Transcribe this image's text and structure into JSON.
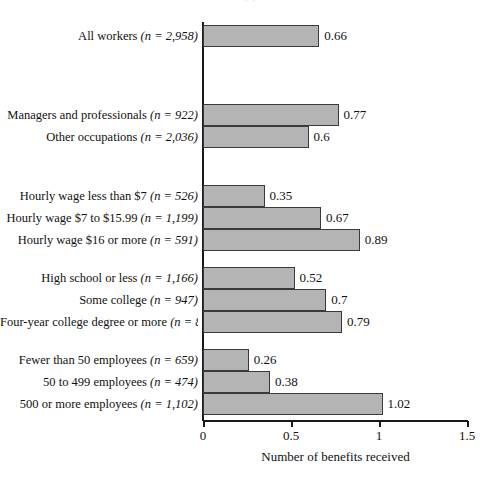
{
  "title_remnant": "( )",
  "axis": {
    "x_title": "Number of benefits received",
    "x_ticks": [
      "0",
      "0.5",
      "1",
      "1.5"
    ],
    "x_min": 0,
    "x_max": 1.5
  },
  "style": {
    "bar_fill": "#b4b4b4",
    "bar_stroke": "#3a3a3a",
    "axis_color": "#1a1a1a",
    "text_color": "#111111"
  },
  "chart_data": {
    "type": "bar",
    "orientation": "horizontal",
    "title": "",
    "xlabel": "Number of benefits received",
    "ylabel": "",
    "xlim": [
      0,
      1.5
    ],
    "grid": false,
    "legend": "none",
    "categories": [
      "All workers (n = 2,958)",
      "Managers and professionals (n = 922)",
      "Other occupations (n = 2,036)",
      "Hourly wage less than $7 (n = 526)",
      "Hourly wage $7 to $15.99 (n = 1,199)",
      "Hourly wage $16 or more (n = 591)",
      "High school or less (n = 1,166)",
      "Some college (n = 947)",
      "Four-year college degree or more (n = 834)",
      "Fewer than 50 employees (n = 659)",
      "50 to 499 employees (n = 474)",
      "500 or more employees (n = 1,102)"
    ],
    "values": [
      0.66,
      0.77,
      0.6,
      0.35,
      0.67,
      0.89,
      0.52,
      0.7,
      0.79,
      0.26,
      0.38,
      1.02
    ],
    "value_labels": [
      "0.66",
      "0.77",
      "0.6",
      "0.35",
      "0.67",
      "0.89",
      "0.52",
      "0.7",
      "0.79",
      "0.26",
      "0.38",
      "1.02"
    ]
  },
  "bars": [
    {
      "label_main": "All workers ",
      "label_n": "(n = 2,958)",
      "value": 0.66,
      "value_label": "0.66",
      "top": 25,
      "clipped": false
    },
    {
      "label_main": "Managers and professionals ",
      "label_n": "(n = 922)",
      "value": 0.77,
      "value_label": "0.77",
      "top": 104,
      "clipped": false
    },
    {
      "label_main": "Other occupations ",
      "label_n": "(n = 2,036)",
      "value": 0.6,
      "value_label": "0.6",
      "top": 126,
      "clipped": false
    },
    {
      "label_main": "Hourly wage less than $7 ",
      "label_n": "(n = 526)",
      "value": 0.35,
      "value_label": "0.35",
      "top": 185,
      "clipped": false
    },
    {
      "label_main": "Hourly wage $7 to $15.99 ",
      "label_n": "(n = 1,199)",
      "value": 0.67,
      "value_label": "0.67",
      "top": 207,
      "clipped": false
    },
    {
      "label_main": "Hourly wage $16 or more ",
      "label_n": "(n = 591)",
      "value": 0.89,
      "value_label": "0.89",
      "top": 229,
      "clipped": false
    },
    {
      "label_main": "High school or less ",
      "label_n": "(n = 1,166)",
      "value": 0.52,
      "value_label": "0.52",
      "top": 267,
      "clipped": false
    },
    {
      "label_main": "Some college ",
      "label_n": "(n = 947)",
      "value": 0.7,
      "value_label": "0.7",
      "top": 289,
      "clipped": false
    },
    {
      "label_main": "Four-year college degree or more ",
      "label_n": "(n = 834)",
      "value": 0.79,
      "value_label": "0.79",
      "top": 311,
      "clipped": true
    },
    {
      "label_main": "Fewer than 50 employees ",
      "label_n": "(n = 659)",
      "value": 0.26,
      "value_label": "0.26",
      "top": 349,
      "clipped": false
    },
    {
      "label_main": "50 to 499 employees ",
      "label_n": "(n = 474)",
      "value": 0.38,
      "value_label": "0.38",
      "top": 371,
      "clipped": false
    },
    {
      "label_main": "500 or more employees ",
      "label_n": "(n = 1,102)",
      "value": 1.02,
      "value_label": "1.02",
      "top": 393,
      "clipped": false
    }
  ]
}
